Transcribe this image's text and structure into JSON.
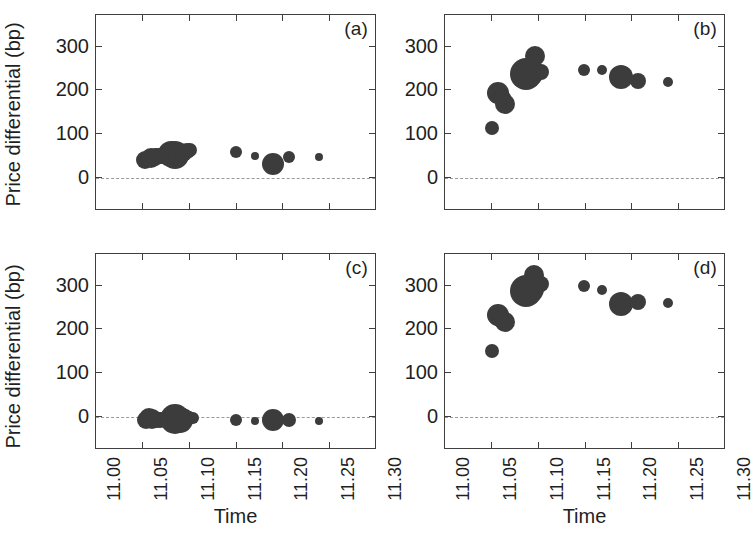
{
  "figure": {
    "width": 740,
    "height": 535,
    "background": "#ffffff",
    "marker_color": "#3c3c3c",
    "axis_color": "#3f3f3f",
    "zero_line_color": "#9a9a9a",
    "layout": "2x2 panel grid",
    "panel_tags": [
      "(a)",
      "(b)",
      "(c)",
      "(d)"
    ],
    "shared_ylabel": "Price differential (bp)",
    "shared_xlabel": "Time"
  },
  "axes": {
    "y": {
      "label": "Price differential (bp)",
      "ticks": [
        0,
        100,
        200,
        300
      ],
      "tick_labels": [
        "0",
        "100",
        "200",
        "300"
      ],
      "limits": [
        -75,
        372
      ]
    },
    "x": {
      "label": "Time",
      "ticks": [
        11.0,
        11.05,
        11.1,
        11.15,
        11.2,
        11.25,
        11.3
      ],
      "tick_labels": [
        "11.00",
        "11.05",
        "11.10",
        "11.15",
        "11.20",
        "11.25",
        "11.30"
      ],
      "limits": [
        11.0,
        11.3
      ],
      "tick_label_rotation": -90
    }
  },
  "chart_data": [
    {
      "id": "panel-a",
      "type": "scatter",
      "tag": "(a)",
      "title": "",
      "xlabel": "Time",
      "ylabel": "Price differential (bp)",
      "xlim": [
        11.0,
        11.3
      ],
      "ylim": [
        -75,
        372
      ],
      "grid": false,
      "legend": "none",
      "zero_reference_line": 0,
      "marker": "filled circle, size encodes volume",
      "points": [
        {
          "x": 11.0525,
          "y": 41,
          "size": 9
        },
        {
          "x": 11.0555,
          "y": 44,
          "size": 8
        },
        {
          "x": 11.0585,
          "y": 47,
          "size": 10
        },
        {
          "x": 11.0625,
          "y": 49,
          "size": 9
        },
        {
          "x": 11.0665,
          "y": 50,
          "size": 8
        },
        {
          "x": 11.0705,
          "y": 51,
          "size": 8
        },
        {
          "x": 11.08,
          "y": 55,
          "size": 13
        },
        {
          "x": 11.0845,
          "y": 52,
          "size": 14
        },
        {
          "x": 11.0885,
          "y": 56,
          "size": 11
        },
        {
          "x": 11.093,
          "y": 58,
          "size": 9
        },
        {
          "x": 11.0975,
          "y": 61,
          "size": 8
        },
        {
          "x": 11.1005,
          "y": 63,
          "size": 7
        },
        {
          "x": 11.149,
          "y": 59,
          "size": 6
        },
        {
          "x": 11.17,
          "y": 50,
          "size": 4
        },
        {
          "x": 11.189,
          "y": 33,
          "size": 11
        },
        {
          "x": 11.206,
          "y": 48,
          "size": 6
        },
        {
          "x": 11.238,
          "y": 48,
          "size": 4
        }
      ]
    },
    {
      "id": "panel-b",
      "type": "scatter",
      "tag": "(b)",
      "title": "",
      "xlabel": "Time",
      "ylabel": "Price differential (bp)",
      "xlim": [
        11.0,
        11.3
      ],
      "ylim": [
        -75,
        372
      ],
      "grid": false,
      "legend": "none",
      "zero_reference_line": 0,
      "marker": "filled circle, size encodes volume",
      "points": [
        {
          "x": 11.0505,
          "y": 114,
          "size": 7
        },
        {
          "x": 11.057,
          "y": 194,
          "size": 11
        },
        {
          "x": 11.0605,
          "y": 183,
          "size": 9
        },
        {
          "x": 11.0645,
          "y": 170,
          "size": 10
        },
        {
          "x": 11.087,
          "y": 238,
          "size": 16
        },
        {
          "x": 11.091,
          "y": 241,
          "size": 14
        },
        {
          "x": 11.096,
          "y": 279,
          "size": 10
        },
        {
          "x": 11.103,
          "y": 243,
          "size": 8
        },
        {
          "x": 11.148,
          "y": 247,
          "size": 6
        },
        {
          "x": 11.168,
          "y": 246,
          "size": 5
        },
        {
          "x": 11.188,
          "y": 231,
          "size": 12
        },
        {
          "x": 11.206,
          "y": 221,
          "size": 8
        },
        {
          "x": 11.238,
          "y": 219,
          "size": 5
        }
      ]
    },
    {
      "id": "panel-c",
      "type": "scatter",
      "tag": "(c)",
      "title": "",
      "xlabel": "Time",
      "ylabel": "Price differential (bp)",
      "xlim": [
        11.0,
        11.3
      ],
      "ylim": [
        -75,
        372
      ],
      "grid": false,
      "legend": "none",
      "zero_reference_line": 0,
      "marker": "filled circle, size encodes volume",
      "points": [
        {
          "x": 11.053,
          "y": -6,
          "size": 9
        },
        {
          "x": 11.0565,
          "y": -2,
          "size": 10
        },
        {
          "x": 11.06,
          "y": -5,
          "size": 10
        },
        {
          "x": 11.064,
          "y": -7,
          "size": 8
        },
        {
          "x": 11.068,
          "y": -6,
          "size": 8
        },
        {
          "x": 11.0715,
          "y": -4,
          "size": 7
        },
        {
          "x": 11.0845,
          "y": -4,
          "size": 15
        },
        {
          "x": 11.0895,
          "y": -7,
          "size": 13
        },
        {
          "x": 11.0945,
          "y": -3,
          "size": 9
        },
        {
          "x": 11.0995,
          "y": -2,
          "size": 7
        },
        {
          "x": 11.1035,
          "y": -2,
          "size": 6
        },
        {
          "x": 11.149,
          "y": -7,
          "size": 6
        },
        {
          "x": 11.17,
          "y": -9,
          "size": 4
        },
        {
          "x": 11.189,
          "y": -7,
          "size": 11
        },
        {
          "x": 11.206,
          "y": -7,
          "size": 7
        },
        {
          "x": 11.238,
          "y": -9,
          "size": 4
        }
      ]
    },
    {
      "id": "panel-d",
      "type": "scatter",
      "tag": "(d)",
      "title": "",
      "xlabel": "Time",
      "ylabel": "Price differential (bp)",
      "xlim": [
        11.0,
        11.3
      ],
      "ylim": [
        -75,
        372
      ],
      "grid": false,
      "legend": "none",
      "zero_reference_line": 0,
      "marker": "filled circle, size encodes volume",
      "points": [
        {
          "x": 11.05,
          "y": 150,
          "size": 7
        },
        {
          "x": 11.0565,
          "y": 233,
          "size": 11
        },
        {
          "x": 11.06,
          "y": 224,
          "size": 9
        },
        {
          "x": 11.064,
          "y": 216,
          "size": 10
        },
        {
          "x": 11.0865,
          "y": 288,
          "size": 16
        },
        {
          "x": 11.0905,
          "y": 292,
          "size": 14
        },
        {
          "x": 11.0955,
          "y": 323,
          "size": 10
        },
        {
          "x": 11.103,
          "y": 303,
          "size": 8
        },
        {
          "x": 11.148,
          "y": 298,
          "size": 6
        },
        {
          "x": 11.168,
          "y": 291,
          "size": 5
        },
        {
          "x": 11.188,
          "y": 258,
          "size": 12
        },
        {
          "x": 11.206,
          "y": 262,
          "size": 8
        },
        {
          "x": 11.238,
          "y": 261,
          "size": 5
        }
      ]
    }
  ]
}
